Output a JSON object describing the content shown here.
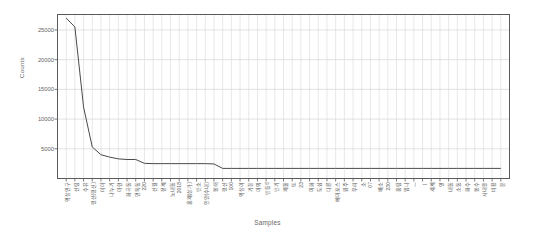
{
  "chart_data": {
    "type": "line",
    "title": "",
    "xlabel": "Samples",
    "ylabel": "Counts",
    "ylim": [
      0,
      27600
    ],
    "xlim": [
      0,
      56
    ],
    "grid": "vertical-major-and-minor, horizontal-major",
    "legend": "none",
    "yticks": [
      5000,
      10000,
      15000,
      20000,
      25000
    ],
    "ytick_labels": [
      "5000",
      "10000",
      "15000",
      "20000",
      "25000"
    ],
    "categories": [
      "역삼인구",
      "신림",
      "수유",
      "행신(행신)",
      "미아",
      "나누기",
      "아현",
      "화곡동",
      "면목동",
      "220",
      "신월",
      "정계",
      "노내동",
      "2018",
      "홍제(상가)",
      "반소",
      "안양(수내)",
      "봉래",
      "행신",
      "100",
      "역삼여",
      "기장",
      "여의",
      "반등5",
      "만기",
      "제물",
      "또",
      "23",
      "이화",
      "도심",
      "다른",
      "에어포스",
      "원주",
      "우리",
      "소",
      "07",
      "배소",
      "230",
      "홍림",
      "임나",
      "ㅡ",
      "ㅣ",
      "세계",
      "영",
      "내동",
      "소동",
      "화수",
      "봉수",
      "시내왕",
      "미용",
      "문"
    ],
    "values": [
      27000,
      25500,
      12000,
      5300,
      4000,
      3600,
      3300,
      3200,
      3200,
      2550,
      2500,
      2500,
      2500,
      2500,
      2500,
      2500,
      2500,
      2450,
      1700,
      1700,
      1700,
      1700,
      1700,
      1700,
      1700,
      1700,
      1700,
      1700,
      1700,
      1700,
      1700,
      1700,
      1700,
      1700,
      1700,
      1700,
      1700,
      1700,
      1700,
      1700,
      1700,
      1700,
      1700,
      1700,
      1700,
      1700,
      1700,
      1700,
      1700,
      1700,
      1700
    ],
    "line_color": "#4a4a4a",
    "grid_color": "#d6d6dc",
    "frame_color": "#5a5a5a",
    "background": "#ffffff"
  }
}
